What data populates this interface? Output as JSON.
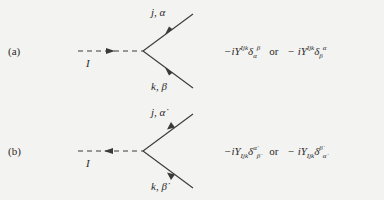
{
  "figure": {
    "panels": [
      {
        "label": "(a)",
        "scalar_label": "I",
        "fermion_top_label": "j, α",
        "fermion_bottom_label": "k, β",
        "scalar_arrow_direction": "right",
        "fermion_arrows": "toward-vertex",
        "formula": {
          "term1_prefix": "−iY",
          "term1_sup": "Ijk",
          "term1_delta": "δ",
          "term1_delta_sub": "α",
          "term1_delta_sup": "β",
          "connector": "or",
          "term2_prefix": "− iY",
          "term2_sup": "Ijk",
          "term2_delta": "δ",
          "term2_delta_sub": "β",
          "term2_delta_sup": "α"
        }
      },
      {
        "label": "(b)",
        "scalar_label": "I",
        "fermion_top_label": "j, α̇",
        "fermion_bottom_label": "k, β̇",
        "scalar_arrow_direction": "left",
        "fermion_arrows": "away-from-vertex",
        "formula": {
          "term1_prefix": "−iY",
          "term1_sub": "Ijk",
          "term1_delta": "δ",
          "term1_delta_sup": "α̇",
          "term1_delta_sub": "β̇",
          "connector": "or",
          "term2_prefix": "− iY",
          "term2_sub": "Ijk",
          "term2_delta": "δ",
          "term2_delta_sup": "β̇",
          "term2_delta_sub": "α̇"
        }
      }
    ],
    "colors": {
      "ink": "#2a2a2a",
      "paper": "#f3f3f1",
      "line": "#3a3a3a"
    }
  }
}
